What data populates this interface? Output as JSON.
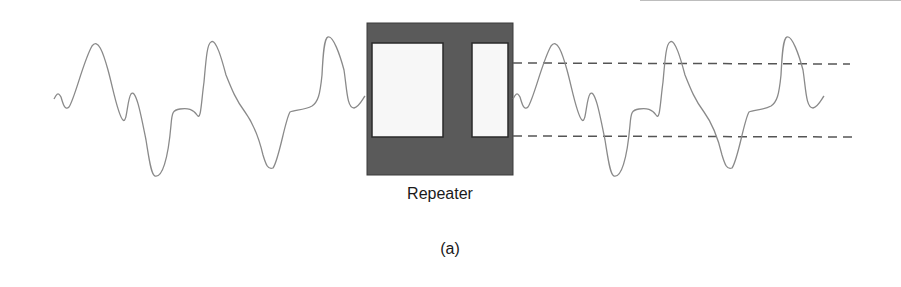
{
  "figure": {
    "repeater_label": "Repeater",
    "caption": "(a)"
  },
  "colors": {
    "waveform": "#8a8a8a",
    "box_fill": "#5a5a5a",
    "box_inner": "#f7f7f7",
    "dashed": "#555555",
    "text": "#1a1a1a"
  },
  "elements": {
    "input_signal": "distorted-waveform",
    "device": "repeater-box",
    "output_signal": "regenerated-waveform",
    "threshold_lines": [
      "upper-threshold",
      "lower-threshold"
    ]
  }
}
